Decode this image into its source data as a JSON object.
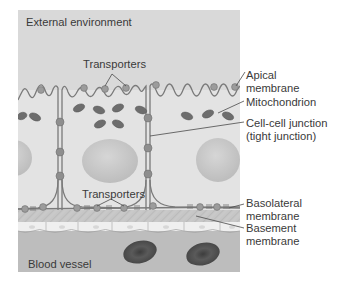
{
  "figure": {
    "labels": {
      "external_environment": "External environment",
      "transporters_top": "Transporters",
      "transporters_bottom": "Transporters",
      "blood_vessel": "Blood vessel"
    },
    "callouts": {
      "apical_line1": "Apical",
      "apical_line2": "membrane",
      "mitochondrion": "Mitochondrion",
      "junction_line1": "Cell-cell junction",
      "junction_line2": "(tight junction)",
      "basolateral_line1": "Basolateral",
      "basolateral_line2": "membrane",
      "basement_line1": "Basement",
      "basement_line2": "membrane"
    },
    "colors": {
      "panel_bg": "#d9d9d9",
      "cell_fill": "#e2e2e2",
      "membrane": "#7a7a7a",
      "protein": "#8c8c8c",
      "mitochondrion": "#6b6b6b",
      "nucleus": "#c8c8c8",
      "basement": "#c4c4c4",
      "endothelium": "#eeeeee",
      "blood": "#bdbdbd",
      "rbc": "#4a4a4a"
    }
  }
}
